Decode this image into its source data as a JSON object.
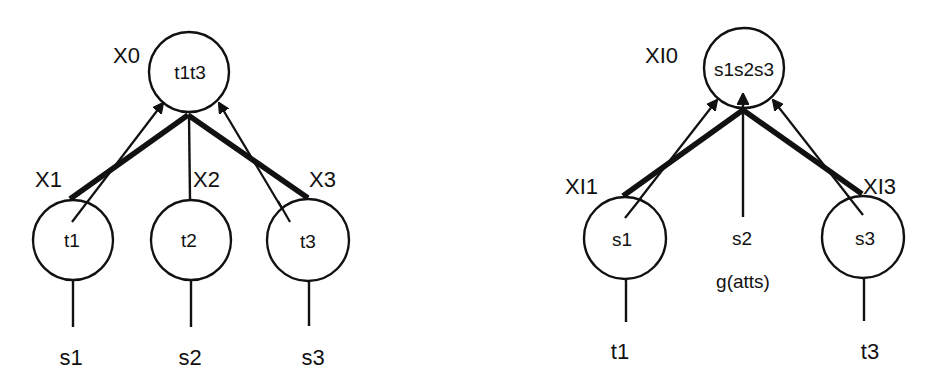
{
  "diagrams": [
    {
      "id": "left",
      "root": {
        "edge_label": "X0",
        "node_label": "t1t3",
        "cx": 189,
        "cy": 72,
        "r": 40,
        "label_x": 113,
        "label_y": 61
      },
      "junction": {
        "x": 188,
        "y": 115
      },
      "children": [
        {
          "edge_label": "X1",
          "node_label": "t1",
          "leaf_label": "s1",
          "cx": 73,
          "cy": 240,
          "r": 40,
          "label_x": 35,
          "label_y": 183,
          "thick_end": {
            "x": 70,
            "y": 199
          },
          "thin_from": {
            "x": 72,
            "y": 222
          },
          "thin_to": {
            "x": 163,
            "y": 103
          },
          "stem_end_y": 327,
          "leaf_y": 358
        },
        {
          "edge_label": "X2",
          "node_label": "t2",
          "leaf_label": "s2",
          "cx": 191,
          "cy": 240,
          "r": 40,
          "label_x": 193,
          "label_y": 183,
          "stem_end_y": 327,
          "leaf_y": 358
        },
        {
          "edge_label": "X3",
          "node_label": "t3",
          "leaf_label": "s3",
          "cx": 308,
          "cy": 240,
          "r": 41,
          "label_x": 309,
          "label_y": 183,
          "thick_end": {
            "x": 308,
            "y": 198
          },
          "thin_from": {
            "x": 290,
            "y": 222
          },
          "thin_to": {
            "x": 219,
            "y": 103
          },
          "stem_end_y": 326,
          "leaf_y": 358
        }
      ]
    },
    {
      "id": "right",
      "root": {
        "edge_label": "XI0",
        "node_label": "s1s2s3",
        "cx": 744,
        "cy": 68,
        "r": 40,
        "label_x": 645,
        "label_y": 63
      },
      "junction": {
        "x": 743,
        "y": 110
      },
      "children": [
        {
          "edge_label": "XI1",
          "node_label": "s1",
          "leaf_label": "t1",
          "cx": 625,
          "cy": 238,
          "r": 41,
          "label_x": 567,
          "label_y": 190,
          "thick_end": {
            "x": 623,
            "y": 196
          },
          "thin_from": {
            "x": 625,
            "y": 218
          },
          "thin_to": {
            "x": 717,
            "y": 100
          },
          "stem_end_y": 322,
          "leaf_y": 352
        },
        {
          "edge_label": "",
          "node_label": "",
          "leaf_label": "s2",
          "sublabel": "g(atts)",
          "no_circle": true,
          "cx": 743,
          "stem_top_y": 110,
          "stem_end_y": 217,
          "leaf_y": 245,
          "sublabel_y": 288
        },
        {
          "edge_label": "XI3",
          "node_label": "s3",
          "leaf_label": "t3",
          "cx": 863,
          "cy": 237,
          "r": 41,
          "label_x": 864,
          "label_y": 190,
          "thick_end": {
            "x": 862,
            "y": 194
          },
          "thin_from": {
            "x": 863,
            "y": 215
          },
          "thin_to": {
            "x": 773,
            "y": 100
          },
          "stem_end_y": 321,
          "leaf_y": 352
        }
      ]
    }
  ],
  "colors": {
    "ink": "#111111",
    "background": "#ffffff"
  }
}
